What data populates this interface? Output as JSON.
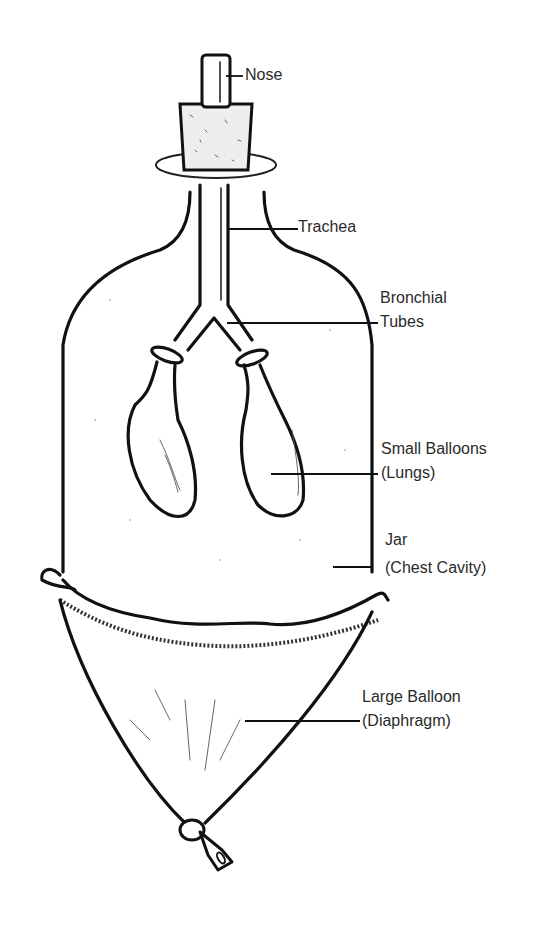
{
  "diagram": {
    "labels": {
      "nose": "Nose",
      "trachea": "Trachea",
      "bronchial_line1": "Bronchial",
      "bronchial_line2": "Tubes",
      "lungs_line1": "Small Balloons",
      "lungs_line2": "(Lungs)",
      "jar_line1": "Jar",
      "jar_line2": "(Chest Cavity)",
      "diaphragm_line1": "Large Balloon",
      "diaphragm_line2": "(Diaphragm)"
    },
    "components": [
      {
        "part": "Nose",
        "represents": "glass tube through stopper"
      },
      {
        "part": "Trachea",
        "represents": "Y-tube stem"
      },
      {
        "part": "Bronchial Tubes",
        "represents": "Y-tube branches"
      },
      {
        "part": "Small Balloons",
        "represents": "Lungs"
      },
      {
        "part": "Jar",
        "represents": "Chest Cavity"
      },
      {
        "part": "Large Balloon",
        "represents": "Diaphragm"
      }
    ],
    "colors": {
      "ink": "#111111",
      "label_text": "#2a2a2a",
      "background": "#ffffff"
    }
  }
}
